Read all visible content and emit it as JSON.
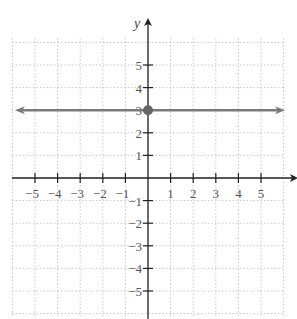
{
  "chart_data": {
    "type": "line",
    "title": "",
    "xlabel": "x",
    "ylabel": "y",
    "xlim": [
      -6,
      6
    ],
    "ylim": [
      -6,
      6
    ],
    "grid": true,
    "x_ticks": [
      -5,
      -4,
      -3,
      -2,
      -1,
      1,
      2,
      3,
      4,
      5
    ],
    "y_ticks": [
      -5,
      -4,
      -3,
      -2,
      -1,
      1,
      2,
      3,
      4,
      5
    ],
    "x_tick_labels": [
      "−5",
      "−4",
      "−3",
      "−2",
      "−1",
      "1",
      "2",
      "3",
      "4",
      "5"
    ],
    "y_tick_labels": [
      "5",
      "4",
      "3",
      "2",
      "1",
      "−1",
      "−2",
      "−3",
      "−4",
      "−5"
    ],
    "series": [
      {
        "name": "y = 3",
        "type": "horizontal-line",
        "y": 3,
        "arrows": "both",
        "color": "#7a7a7a"
      }
    ],
    "points": [
      {
        "x": 0,
        "y": 3,
        "label": "y-intercept",
        "color": "#666666"
      }
    ]
  },
  "labels": {
    "x_axis": "x",
    "y_axis": "y"
  }
}
